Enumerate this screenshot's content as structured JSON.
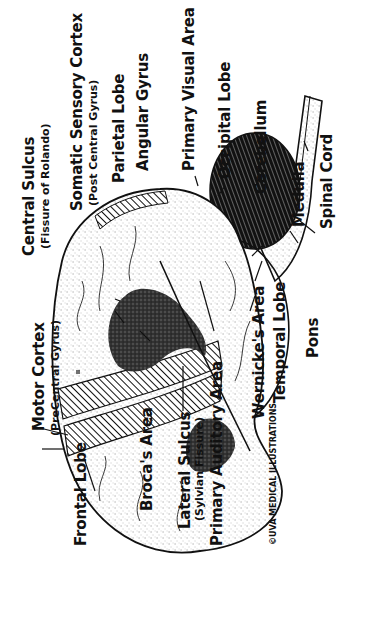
{
  "diagram": {
    "orientation": "rotated -90deg (text reads bottom-to-top)",
    "labels": {
      "central_sulcus": "Central Sulcus",
      "central_sulcus_sub": "(Fissure of Rolando)",
      "somatic_sensory_cortex": "Somatic Sensory Cortex",
      "somatic_sensory_cortex_sub": "(Post Central Gyrus)",
      "parietal_lobe": "Parietal Lobe",
      "angular_gyrus": "Angular Gyrus",
      "primary_visual_area": "Primary Visual Area",
      "occipital_lobe": "Occipital Lobe",
      "cerebellum": "Cerebellum",
      "medulla": "Medulla",
      "spinal_cord": "Spinal Cord",
      "motor_cortex": "Motor Cortex",
      "motor_cortex_sub": "(PreCentral Gyrus)",
      "frontal_lobe": "Frontal Lobe",
      "brocas_area": "Broca's Area",
      "lateral_sulcus": "Lateral Sulcus",
      "lateral_sulcus_sub": "(Sylvian Fissure)",
      "primary_auditory_area": "Primary Auditory Area",
      "wernickes_area": "Wernicke's Area",
      "temporal_lobe": "Temporal Lobe",
      "pons": "Pons"
    },
    "credit": "©UVA MEDICAL ILLUSTRATIONS",
    "colors": {
      "ink": "#111111",
      "background": "#ffffff",
      "stipple": "#555555"
    }
  }
}
